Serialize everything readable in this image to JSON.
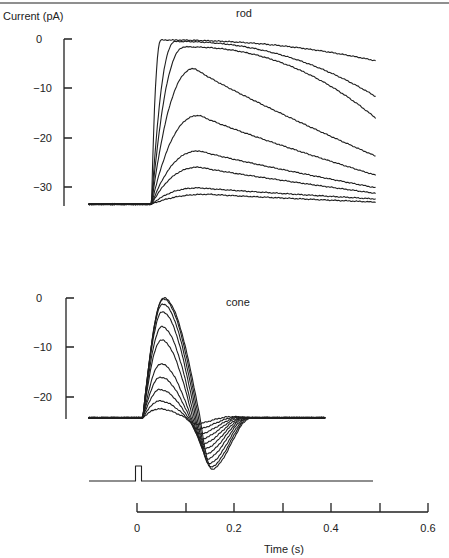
{
  "chart_data": [
    {
      "type": "line",
      "title": "rod",
      "ylabel": "Current (pA)",
      "xlabel": "Time (s)",
      "ylim": [
        -34,
        0
      ],
      "yticks": [
        0,
        -10,
        -20,
        -30
      ],
      "xlim": [
        -0.1,
        0.6
      ],
      "baseline_pA": -33.5,
      "flash_time_s": 0.0,
      "series_description": "Family of 9 flash responses of increasing intensity",
      "series": [
        {
          "name": "flash 1",
          "peak_pA": -31.5,
          "peak_time_s": 0.15,
          "end_pA": -33.5
        },
        {
          "name": "flash 2",
          "peak_pA": -30.2,
          "peak_time_s": 0.13,
          "end_pA": -33.0
        },
        {
          "name": "flash 3",
          "peak_pA": -26.0,
          "peak_time_s": 0.13,
          "end_pA": -32.6
        },
        {
          "name": "flash 4",
          "peak_pA": -22.7,
          "peak_time_s": 0.13,
          "end_pA": -32.0
        },
        {
          "name": "flash 5",
          "peak_pA": -15.5,
          "peak_time_s": 0.13,
          "end_pA": -30.6
        },
        {
          "name": "flash 6",
          "peak_pA": -6.0,
          "peak_time_s": 0.12,
          "end_pA": -28.0
        },
        {
          "name": "flash 7",
          "peak_pA": -1.6,
          "peak_time_s": 0.1,
          "end_pA": -25.4
        },
        {
          "name": "flash 8",
          "peak_pA": -0.5,
          "peak_time_s": 0.08,
          "end_pA": -18.5
        },
        {
          "name": "flash 9",
          "peak_pA": -0.2,
          "peak_time_s": 0.05,
          "end_pA": -6.8
        }
      ]
    },
    {
      "type": "line",
      "title": "cone",
      "ylabel": "Current (pA)",
      "xlabel": "Time (s)",
      "ylim": [
        -25,
        0
      ],
      "yticks": [
        0,
        -10,
        -20
      ],
      "xlim": [
        -0.1,
        0.5
      ],
      "baseline_pA": -24.2,
      "flash_time_s": 0.0,
      "series_description": "Family of 11 flash responses; biphasic with undershoot near 0.15 s",
      "series": [
        {
          "name": "flash 1",
          "peak_pA": -22.4,
          "trough_pA": -25.5
        },
        {
          "name": "flash 2",
          "peak_pA": -20.8,
          "trough_pA": -26.5
        },
        {
          "name": "flash 3",
          "peak_pA": -18.5,
          "trough_pA": -27.5
        },
        {
          "name": "flash 4",
          "peak_pA": -16.0,
          "trough_pA": -28.5
        },
        {
          "name": "flash 5",
          "peak_pA": -13.3,
          "trough_pA": -29.5
        },
        {
          "name": "flash 6",
          "peak_pA": -8.5,
          "trough_pA": -30.5
        },
        {
          "name": "flash 7",
          "peak_pA": -5.8,
          "trough_pA": -31.5
        },
        {
          "name": "flash 8",
          "peak_pA": -2.8,
          "trough_pA": -32.5
        },
        {
          "name": "flash 9",
          "peak_pA": -1.2,
          "trough_pA": -33.5
        },
        {
          "name": "flash 10",
          "peak_pA": -0.2,
          "trough_pA": -34.2
        },
        {
          "name": "flash 11",
          "peak_pA": 0.0,
          "trough_pA": -34.6
        }
      ]
    }
  ],
  "labels": {
    "rod_ylabel": "Current  (pA)",
    "rod_title": "rod",
    "cone_title": "cone",
    "xlabel": "Time  (s)",
    "rod_yticks": [
      "0",
      "−10",
      "−20",
      "−30"
    ],
    "cone_yticks": [
      "0",
      "−10",
      "−20"
    ],
    "xticks": [
      "0",
      "0.2",
      "0.4",
      "0.6"
    ]
  },
  "stimulus": {
    "label": "flash monitor",
    "onset_s": 0.0,
    "duration_s": 0.012
  }
}
